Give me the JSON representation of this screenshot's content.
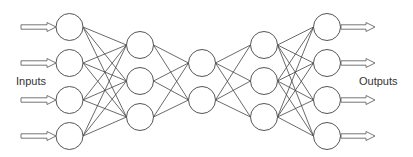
{
  "diagram": {
    "type": "feedforward-neural-network",
    "labels": {
      "inputs": "Inputs",
      "outputs": "Outputs"
    },
    "node_radius": 13.5,
    "colors": {
      "node_stroke": "#555555",
      "node_fill": "#ffffff",
      "edge": "#444444",
      "arrow_stroke": "#666666",
      "arrow_fill": "#ffffff",
      "text": "#333333"
    },
    "layers": [
      {
        "name": "input",
        "x": 69.5,
        "nodes_y": [
          27,
          63,
          100,
          136
        ]
      },
      {
        "name": "hidden-1",
        "x": 140,
        "nodes_y": [
          45,
          81,
          117
        ]
      },
      {
        "name": "bottleneck",
        "x": 202,
        "nodes_y": [
          63,
          100
        ]
      },
      {
        "name": "hidden-3",
        "x": 264,
        "nodes_y": [
          45,
          81,
          117
        ]
      },
      {
        "name": "output",
        "x": 327,
        "nodes_y": [
          27,
          63,
          100,
          136
        ]
      }
    ],
    "input_arrows": {
      "x_start": 21,
      "x_end": 56,
      "ys": [
        27,
        63,
        100,
        136
      ]
    },
    "output_arrows": {
      "x_start": 341,
      "x_end": 375,
      "ys": [
        27,
        63,
        100,
        136
      ]
    },
    "connectivity": "fully-connected"
  }
}
